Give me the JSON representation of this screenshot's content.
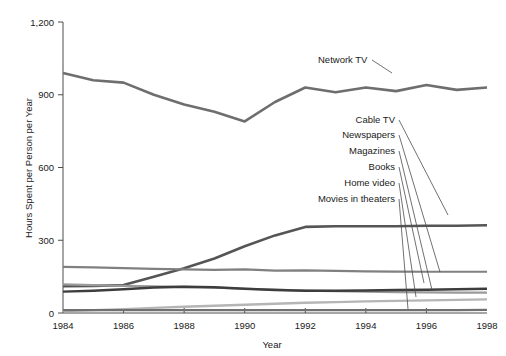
{
  "chart_data": {
    "type": "line",
    "title": "",
    "xlabel": "Year",
    "ylabel": "Hours Spent per Person per Year",
    "x": [
      1984,
      1985,
      1986,
      1987,
      1988,
      1989,
      1990,
      1991,
      1992,
      1993,
      1994,
      1995,
      1996,
      1997,
      1998
    ],
    "xlim": [
      1984,
      1998
    ],
    "ylim": [
      0,
      1200
    ],
    "xticks": [
      "1984",
      "1986",
      "1988",
      "1990",
      "1992",
      "1994",
      "1996",
      "1998"
    ],
    "xtick_values": [
      1984,
      1986,
      1988,
      1990,
      1992,
      1994,
      1996,
      1998
    ],
    "yticks": [
      "0",
      "300",
      "600",
      "900",
      "1,200"
    ],
    "ytick_values": [
      0,
      300,
      600,
      900,
      1200
    ],
    "grid": false,
    "legend": "inline-labels-with-leader-lines",
    "series": [
      {
        "name": "Network TV",
        "color": "#6e6e6e",
        "width": 2.6,
        "values": [
          990,
          960,
          950,
          900,
          860,
          830,
          790,
          870,
          930,
          910,
          930,
          915,
          940,
          920,
          930
        ]
      },
      {
        "name": "Cable TV",
        "color": "#555555",
        "width": 2.6,
        "values": [
          110,
          112,
          115,
          150,
          185,
          225,
          275,
          320,
          355,
          358,
          358,
          358,
          360,
          360,
          362
        ]
      },
      {
        "name": "Newspapers",
        "color": "#808080",
        "width": 2.2,
        "values": [
          190,
          188,
          185,
          182,
          180,
          178,
          180,
          175,
          176,
          174,
          172,
          171,
          170,
          170,
          170
        ]
      },
      {
        "name": "Magazines",
        "color": "#9a9a9a",
        "width": 2.2,
        "values": [
          118,
          115,
          112,
          110,
          108,
          105,
          100,
          96,
          92,
          90,
          88,
          86,
          85,
          84,
          84
        ]
      },
      {
        "name": "Books",
        "color": "#3d3d3d",
        "width": 2.4,
        "values": [
          88,
          92,
          98,
          105,
          108,
          106,
          100,
          95,
          92,
          92,
          93,
          95,
          96,
          98,
          100
        ]
      },
      {
        "name": "Home video",
        "color": "#b5b5b5",
        "width": 2.4,
        "values": [
          8,
          12,
          16,
          21,
          26,
          30,
          34,
          38,
          42,
          45,
          48,
          50,
          52,
          54,
          56
        ]
      },
      {
        "name": "Movies in theaters",
        "color": "#707070",
        "width": 2.2,
        "values": [
          12,
          12,
          12,
          12,
          12,
          12,
          12,
          12,
          12,
          12,
          12,
          12,
          12,
          12,
          13
        ]
      }
    ],
    "annotations": [
      {
        "text": "Network TV",
        "label_x": 318,
        "label_y": 63,
        "anchor": "start",
        "leader": [
          [
            372,
            60
          ],
          [
            392,
            73
          ]
        ]
      },
      {
        "text": "Cable TV",
        "label_x": 395,
        "label_y": 123,
        "anchor": "end",
        "leader": [
          [
            399,
            120
          ],
          [
            448,
            215
          ]
        ]
      },
      {
        "text": "Newspapers",
        "label_x": 395,
        "label_y": 138,
        "anchor": "end",
        "leader": [
          [
            399,
            135
          ],
          [
            440,
            272
          ]
        ]
      },
      {
        "text": "Magazines",
        "label_x": 395,
        "label_y": 154,
        "anchor": "end",
        "leader": [
          [
            399,
            151
          ],
          [
            432,
            290
          ]
        ]
      },
      {
        "text": "Books",
        "label_x": 395,
        "label_y": 170,
        "anchor": "end",
        "leader": [
          [
            399,
            167
          ],
          [
            424,
            283
          ]
        ]
      },
      {
        "text": "Home video",
        "label_x": 395,
        "label_y": 186,
        "anchor": "end",
        "leader": [
          [
            399,
            183
          ],
          [
            416,
            297
          ]
        ]
      },
      {
        "text": "Movies in theaters",
        "label_x": 395,
        "label_y": 202,
        "anchor": "end",
        "leader": [
          [
            399,
            199
          ],
          [
            408,
            309
          ]
        ]
      }
    ]
  }
}
